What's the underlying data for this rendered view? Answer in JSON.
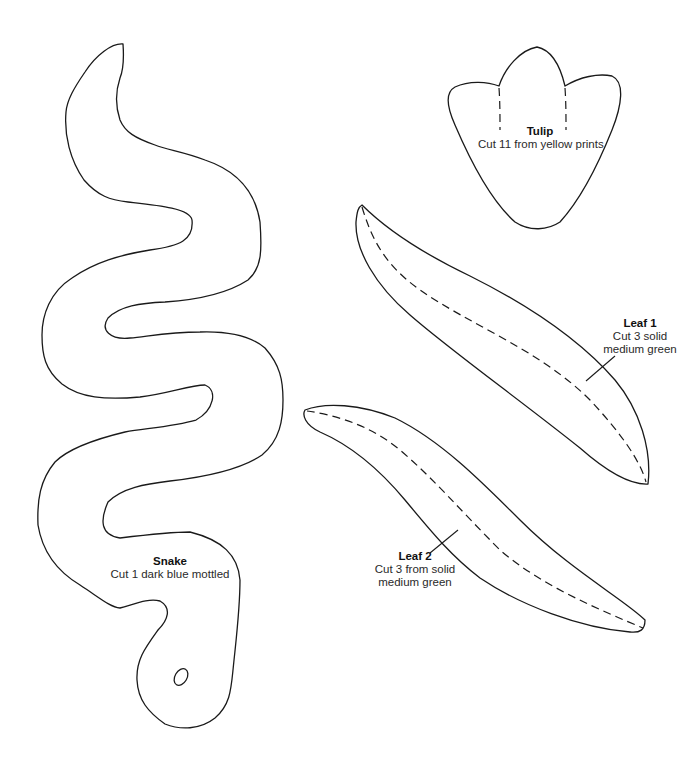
{
  "patterns": {
    "snake": {
      "title": "Snake",
      "instructions": [
        "Cut 1 dark blue mottled"
      ]
    },
    "tulip": {
      "title": "Tulip",
      "instructions": [
        "Cut 11 from yellow prints"
      ]
    },
    "leaf1": {
      "title": "Leaf 1",
      "instructions": [
        "Cut 3 solid",
        "medium green"
      ]
    },
    "leaf2": {
      "title": "Leaf 2",
      "instructions": [
        "Cut 3 from solid",
        "medium green"
      ]
    }
  },
  "colors": {
    "line": "#1a1a1a",
    "background": "#ffffff"
  }
}
